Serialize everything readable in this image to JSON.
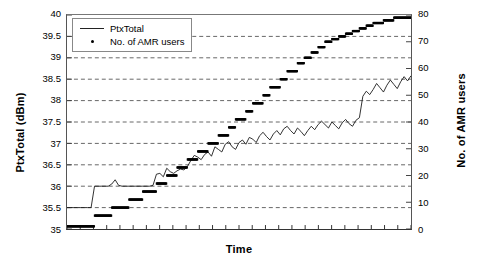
{
  "chart_data": {
    "type": "line",
    "title": "",
    "xlabel": "Time",
    "ylabel": "PtxTotal (dBm)",
    "ylabel_secondary": "No. of AMR users",
    "grid": true,
    "legend_position": "top-left",
    "axes": {
      "x": {
        "min": 0,
        "max": 100,
        "ticks_labeled": false,
        "tick_count": 26
      },
      "y_left": {
        "min": 35,
        "max": 40,
        "step": 0.5,
        "ticks": [
          "35",
          "35.5",
          "36",
          "36.5",
          "37",
          "37.5",
          "38",
          "38.5",
          "39",
          "39.5",
          "40"
        ]
      },
      "y_right": {
        "min": 0,
        "max": 80,
        "step": 10,
        "ticks": [
          "0",
          "10",
          "20",
          "30",
          "40",
          "50",
          "60",
          "70",
          "80"
        ]
      }
    },
    "legend": [
      {
        "label": "PtxTotal",
        "marker": "line"
      },
      {
        "label": "No. of AMR users",
        "marker": "dot"
      }
    ],
    "series": [
      {
        "name": "PtxTotal",
        "marker": "line",
        "axis": "left",
        "unit": "dBm",
        "color": "#1a1a1a",
        "x": [
          0,
          1,
          2,
          3,
          4,
          5,
          6,
          7,
          8,
          9,
          10,
          11,
          12,
          13,
          14,
          15,
          16,
          17,
          18,
          19,
          20,
          21,
          22,
          23,
          24,
          25,
          26,
          27,
          28,
          29,
          30,
          31,
          32,
          33,
          34,
          35,
          36,
          37,
          38,
          39,
          40,
          41,
          42,
          43,
          44,
          45,
          46,
          47,
          48,
          49,
          50,
          51,
          52,
          53,
          54,
          55,
          56,
          57,
          58,
          59,
          60,
          61,
          62,
          63,
          64,
          65,
          66,
          67,
          68,
          69,
          70,
          71,
          72,
          73,
          74,
          75,
          76,
          77,
          78,
          79,
          80,
          81,
          82,
          83,
          84,
          85,
          86,
          87,
          88,
          89,
          90,
          91,
          92,
          93,
          94,
          95,
          96,
          97,
          98,
          99,
          100
        ],
        "values": [
          35.5,
          35.5,
          35.5,
          35.5,
          35.5,
          35.5,
          35.5,
          35.5,
          36.0,
          36.0,
          36.0,
          36.0,
          36.0,
          36.05,
          36.15,
          36.02,
          36.0,
          36.0,
          36.0,
          36.0,
          36.0,
          36.0,
          36.0,
          36.0,
          36.0,
          36.02,
          36.28,
          36.3,
          36.22,
          36.42,
          36.34,
          36.3,
          36.36,
          36.4,
          36.38,
          36.46,
          36.6,
          36.72,
          36.68,
          36.62,
          36.74,
          36.8,
          36.7,
          36.92,
          36.86,
          36.8,
          36.98,
          37.04,
          36.92,
          36.86,
          37.02,
          37.08,
          36.98,
          37.14,
          37.1,
          37.02,
          37.18,
          37.26,
          37.16,
          37.08,
          37.22,
          37.3,
          37.2,
          37.34,
          37.4,
          37.3,
          37.22,
          37.36,
          37.28,
          37.18,
          37.3,
          37.4,
          37.32,
          37.44,
          37.52,
          37.44,
          37.36,
          37.5,
          37.42,
          37.34,
          37.48,
          37.56,
          37.46,
          37.4,
          37.54,
          37.6,
          38.1,
          38.22,
          38.14,
          38.26,
          38.4,
          38.3,
          38.2,
          38.36,
          38.48,
          38.38,
          38.28,
          38.44,
          38.56,
          38.46,
          38.58
        ]
      },
      {
        "name": "No. of AMR users",
        "marker": "dot",
        "axis": "right",
        "unit": "users",
        "color": "#000000",
        "x": [
          0,
          1,
          2,
          3,
          4,
          5,
          6,
          7,
          8,
          9,
          10,
          11,
          12,
          13,
          14,
          15,
          16,
          17,
          18,
          19,
          20,
          21,
          22,
          23,
          24,
          25,
          26,
          27,
          28,
          29,
          30,
          31,
          32,
          33,
          34,
          35,
          36,
          37,
          38,
          39,
          40,
          41,
          42,
          43,
          44,
          45,
          46,
          47,
          48,
          49,
          50,
          51,
          52,
          53,
          54,
          55,
          56,
          57,
          58,
          59,
          60,
          61,
          62,
          63,
          64,
          65,
          66,
          67,
          68,
          69,
          70,
          71,
          72,
          73,
          74,
          75,
          76,
          77,
          78,
          79,
          80,
          81,
          82,
          83,
          84,
          85,
          86,
          87,
          88,
          89,
          90,
          91,
          92,
          93,
          94,
          95,
          96,
          97,
          98,
          99,
          100
        ],
        "values": [
          1,
          1,
          1,
          1,
          1,
          1,
          1,
          1,
          5,
          5,
          5,
          5,
          5,
          8,
          8,
          8,
          8,
          8,
          11,
          11,
          11,
          11,
          14,
          14,
          14,
          14,
          17,
          17,
          17,
          20,
          20,
          20,
          23,
          23,
          23,
          26,
          26,
          26,
          29,
          29,
          29,
          32,
          32,
          32,
          35,
          35,
          35,
          38,
          38,
          41,
          41,
          41,
          44,
          44,
          47,
          47,
          47,
          50,
          50,
          53,
          53,
          53,
          56,
          56,
          59,
          59,
          59,
          62,
          62,
          64,
          64,
          66,
          66,
          68,
          68,
          70,
          70,
          71,
          71,
          72,
          72,
          73,
          73,
          74,
          74,
          75,
          75,
          76,
          76,
          77,
          77,
          77,
          78,
          78,
          78,
          79,
          79,
          79,
          79,
          79,
          79
        ]
      }
    ]
  }
}
